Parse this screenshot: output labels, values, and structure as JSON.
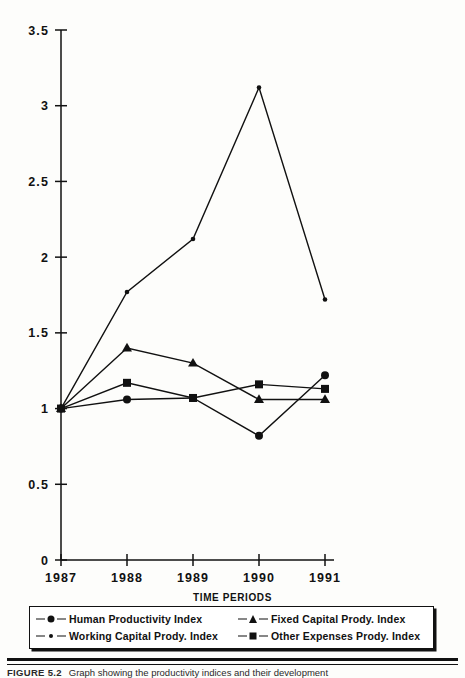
{
  "figure": {
    "axis_title": "TIME PERIODS",
    "caption_number": "FIGURE 5.2",
    "caption_text": "Graph showing the productivity indices and their development"
  },
  "legend": {
    "entries": [
      {
        "label": "Human Productivity Index",
        "marker": "circle-marker"
      },
      {
        "label": "Fixed Capital Prody. Index",
        "marker": "triangle-marker"
      },
      {
        "label": "Working Capital Prody. Index",
        "marker": "dot-marker"
      },
      {
        "label": "Other Expenses Prody. Index",
        "marker": "square-marker"
      }
    ]
  },
  "axes": {
    "y_ticks": [
      "0",
      "0.5",
      "1",
      "1.5",
      "2",
      "2.5",
      "3",
      "3.5"
    ],
    "x_ticks": [
      "1987",
      "1988",
      "1989",
      "1990",
      "1991"
    ]
  },
  "colors": {
    "ink": "#111111",
    "paper": "#fdfdfb"
  },
  "chart_data": {
    "type": "line",
    "title": "",
    "xlabel": "TIME PERIODS",
    "ylabel": "",
    "categories": [
      "1987",
      "1988",
      "1989",
      "1990",
      "1991"
    ],
    "ylim": [
      0,
      3.5
    ],
    "ytick_step": 0.5,
    "grid": false,
    "legend_position": "bottom",
    "series": [
      {
        "name": "Human Productivity Index",
        "marker": "circle",
        "values": [
          1.0,
          1.06,
          1.07,
          0.82,
          1.22
        ]
      },
      {
        "name": "Fixed Capital Prody. Index",
        "marker": "triangle",
        "values": [
          1.0,
          1.4,
          1.3,
          1.06,
          1.06
        ]
      },
      {
        "name": "Working Capital Prody. Index",
        "marker": "dot",
        "values": [
          1.0,
          1.77,
          2.12,
          3.12,
          1.72
        ]
      },
      {
        "name": "Other Expenses Prody. Index",
        "marker": "square",
        "values": [
          1.0,
          1.17,
          1.07,
          1.16,
          1.13
        ]
      }
    ]
  }
}
